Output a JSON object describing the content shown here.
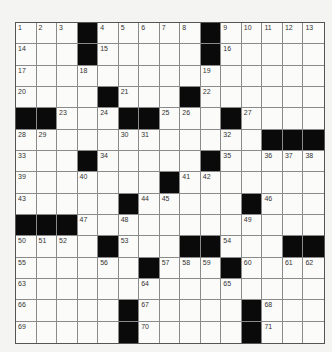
{
  "puzzle": {
    "rows": 15,
    "cols": 15,
    "colors": {
      "black": "#0a0a0a",
      "white": "#fbfbf9",
      "grid_line": "#8a8a8a"
    },
    "layout": [
      [
        "1",
        "2",
        "3",
        "#",
        "4",
        "5",
        "6",
        "7",
        "8",
        "#",
        "9",
        "10",
        "11",
        "12",
        "13"
      ],
      [
        "14",
        "",
        "",
        "#",
        "15",
        "",
        "",
        "",
        "",
        "#",
        "16",
        "",
        "",
        "",
        ""
      ],
      [
        "17",
        "",
        "",
        "18",
        "",
        "",
        "",
        "",
        "",
        "19",
        "",
        "",
        "",
        "",
        ""
      ],
      [
        "20",
        "",
        "",
        "",
        "#",
        "21",
        "",
        "",
        "#",
        "22",
        "",
        "",
        "",
        "",
        ""
      ],
      [
        "#",
        "#",
        "23",
        "",
        "24",
        "#",
        "#",
        "25",
        "26",
        "",
        "#",
        "27",
        "",
        "",
        ""
      ],
      [
        "28",
        "29",
        "",
        "",
        "",
        "30",
        "31",
        "",
        "",
        "",
        "32",
        "",
        "#",
        "#",
        "#"
      ],
      [
        "33",
        "",
        "",
        "#",
        "34",
        "",
        "",
        "",
        "",
        "#",
        "35",
        "",
        "36",
        "37",
        "38"
      ],
      [
        "39",
        "",
        "",
        "40",
        "",
        "",
        "",
        "#",
        "41",
        "42",
        "",
        "",
        "",
        "",
        ""
      ],
      [
        "43",
        "",
        "",
        "",
        "",
        "#",
        "44",
        "45",
        "",
        "",
        "",
        "#",
        "46",
        "",
        ""
      ],
      [
        "#",
        "#",
        "#",
        "47",
        "",
        "48",
        "",
        "",
        "",
        "",
        "",
        "49",
        "",
        "",
        ""
      ],
      [
        "50",
        "51",
        "52",
        "",
        "#",
        "53",
        "",
        "",
        "#",
        "#",
        "54",
        "",
        "",
        "#",
        "#"
      ],
      [
        "55",
        "",
        "",
        "",
        "56",
        "",
        "#",
        "57",
        "58",
        "59",
        "#",
        "60",
        "",
        "61",
        "62"
      ],
      [
        "63",
        "",
        "",
        "",
        "",
        "",
        "64",
        "",
        "",
        "",
        "65",
        "",
        "",
        "",
        ""
      ],
      [
        "66",
        "",
        "",
        "",
        "",
        "#",
        "67",
        "",
        "",
        "",
        "",
        "#",
        "68",
        "",
        ""
      ],
      [
        "69",
        "",
        "",
        "",
        "",
        "#",
        "70",
        "",
        "",
        "",
        "",
        "#",
        "71",
        "",
        ""
      ]
    ]
  }
}
